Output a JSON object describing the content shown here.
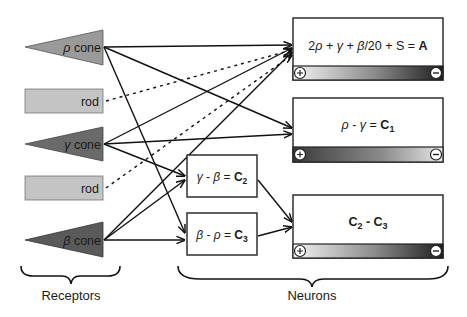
{
  "receptors": {
    "group_label": "Receptors",
    "items": [
      {
        "id": "rho_cone",
        "type": "cone",
        "symbol": "ρ",
        "label": "cone",
        "fill": "#9a9a9a"
      },
      {
        "id": "rod1",
        "type": "rod",
        "label": "rod",
        "fill": "#c4c4c4"
      },
      {
        "id": "gamma_cone",
        "type": "cone",
        "symbol": "γ",
        "label": "cone",
        "fill": "#6a6a6a"
      },
      {
        "id": "rod2",
        "type": "rod",
        "label": "rod",
        "fill": "#c4c4c4"
      },
      {
        "id": "beta_cone",
        "type": "cone",
        "symbol": "β",
        "label": "cone",
        "fill": "#5a5a5a"
      }
    ]
  },
  "neurons": {
    "group_label": "Neurons",
    "A": {
      "formula_parts": [
        "2",
        "ρ",
        " + ",
        "γ",
        " + ",
        "β",
        "/20 + S = ",
        "A"
      ],
      "bar": {
        "left_sign": "+",
        "right_sign": "−",
        "direction": "light-to-dark"
      }
    },
    "C1": {
      "formula_parts": [
        "ρ",
        " - ",
        "γ",
        " = ",
        "C",
        "1"
      ],
      "bar": {
        "left_sign": "+",
        "right_sign": "−",
        "direction": "dark-to-light"
      }
    },
    "C2": {
      "formula_parts": [
        "γ",
        " - ",
        "β",
        " = ",
        "C",
        "2"
      ]
    },
    "C3": {
      "formula_parts": [
        "β",
        " - ",
        "ρ",
        " = ",
        "C",
        "3"
      ]
    },
    "C2C3": {
      "formula_parts": [
        "C",
        "2",
        " - ",
        "C",
        "3"
      ],
      "bar": {
        "left_sign": "+",
        "right_sign": "−",
        "direction": "light-to-dark"
      }
    }
  },
  "connections": [
    {
      "from": "rho_cone",
      "to": "A",
      "style": "solid"
    },
    {
      "from": "rho_cone",
      "to": "C1",
      "style": "solid"
    },
    {
      "from": "rho_cone",
      "to": "C3",
      "style": "solid"
    },
    {
      "from": "rod1",
      "to": "A",
      "style": "dotted"
    },
    {
      "from": "gamma_cone",
      "to": "A",
      "style": "solid"
    },
    {
      "from": "gamma_cone",
      "to": "C1",
      "style": "solid"
    },
    {
      "from": "gamma_cone",
      "to": "C2",
      "style": "solid"
    },
    {
      "from": "rod2",
      "to": "A",
      "style": "dotted"
    },
    {
      "from": "beta_cone",
      "to": "A",
      "style": "solid"
    },
    {
      "from": "beta_cone",
      "to": "C2",
      "style": "solid"
    },
    {
      "from": "beta_cone",
      "to": "C3",
      "style": "solid"
    },
    {
      "from": "C2",
      "to": "C2C3",
      "style": "solid"
    },
    {
      "from": "C3",
      "to": "C2C3",
      "style": "solid"
    }
  ]
}
